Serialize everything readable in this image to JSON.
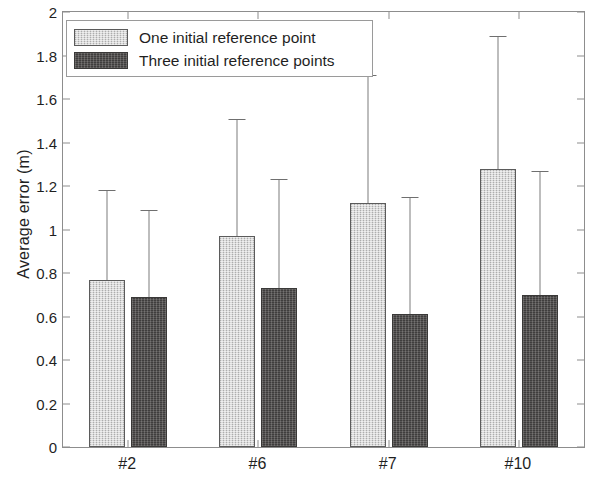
{
  "chart_data": {
    "type": "bar",
    "title": "",
    "subtitle": "",
    "xlabel": "",
    "ylabel": "Average error (m)",
    "categories": [
      "#2",
      "#6",
      "#7",
      "#10"
    ],
    "ylim": [
      0,
      2
    ],
    "ytick_labels": [
      "0",
      "0.2",
      "0.4",
      "0.6",
      "0.8",
      "1",
      "1.2",
      "1.4",
      "1.6",
      "1.8",
      "2"
    ],
    "ytick_values": [
      0,
      0.2,
      0.4,
      0.6,
      0.8,
      1.0,
      1.2,
      1.4,
      1.6,
      1.8,
      2.0
    ],
    "grid": false,
    "legend_position": "upper left",
    "error_bars": "upper-only",
    "series": [
      {
        "name": "One initial reference point",
        "color": "#c9c9c9",
        "edge_color": "#5b5b5b",
        "values": [
          0.77,
          0.97,
          1.12,
          1.28
        ],
        "error_high": [
          1.18,
          1.51,
          1.71,
          1.89
        ]
      },
      {
        "name": "Three initial reference points",
        "color": "#4d4b4a",
        "edge_color": "#3a3938",
        "values": [
          0.69,
          0.73,
          0.61,
          0.7
        ],
        "error_high": [
          1.09,
          1.23,
          1.15,
          1.27
        ]
      }
    ]
  },
  "legend": {
    "entries": [
      {
        "label": "One initial reference point",
        "swatch": "light-gray-swatch"
      },
      {
        "label": "Three initial reference points",
        "swatch": "dark-gray-swatch"
      }
    ]
  },
  "axes": {
    "y_axis_title": "Average error (m)",
    "error_bar_color": "#7c7c7c",
    "axis_color": "#8d8d8d"
  }
}
